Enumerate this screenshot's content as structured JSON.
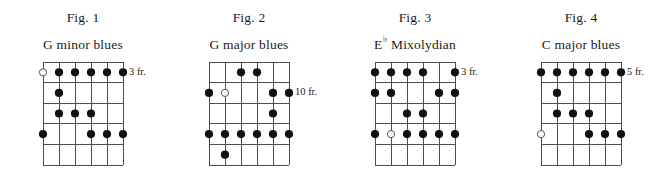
{
  "figures": [
    {
      "number": "Fig. 1",
      "title": "G minor blues",
      "title_root": "G",
      "title_accidental": "",
      "title_rest": "minor blues",
      "fret_label": "3 fr.",
      "fret_label_row": 1,
      "strings": 6,
      "frets": 5,
      "markers": [
        {
          "string": 1,
          "fret": 1,
          "type": "open"
        },
        {
          "string": 2,
          "fret": 1,
          "type": "filled"
        },
        {
          "string": 3,
          "fret": 1,
          "type": "filled"
        },
        {
          "string": 4,
          "fret": 1,
          "type": "filled"
        },
        {
          "string": 5,
          "fret": 1,
          "type": "filled"
        },
        {
          "string": 6,
          "fret": 1,
          "type": "filled"
        },
        {
          "string": 2,
          "fret": 2,
          "type": "filled"
        },
        {
          "string": 2,
          "fret": 3,
          "type": "filled"
        },
        {
          "string": 3,
          "fret": 3,
          "type": "filled"
        },
        {
          "string": 4,
          "fret": 3,
          "type": "filled"
        },
        {
          "string": 1,
          "fret": 4,
          "type": "filled"
        },
        {
          "string": 4,
          "fret": 4,
          "type": "filled"
        },
        {
          "string": 5,
          "fret": 4,
          "type": "filled"
        },
        {
          "string": 6,
          "fret": 4,
          "type": "filled"
        }
      ]
    },
    {
      "number": "Fig. 2",
      "title": "G major blues",
      "title_root": "G",
      "title_accidental": "",
      "title_rest": "major blues",
      "fret_label": "10  fr.",
      "fret_label_row": 2,
      "strings": 6,
      "frets": 5,
      "markers": [
        {
          "string": 3,
          "fret": 1,
          "type": "filled"
        },
        {
          "string": 4,
          "fret": 1,
          "type": "filled"
        },
        {
          "string": 1,
          "fret": 2,
          "type": "filled"
        },
        {
          "string": 2,
          "fret": 2,
          "type": "open"
        },
        {
          "string": 5,
          "fret": 2,
          "type": "filled"
        },
        {
          "string": 6,
          "fret": 2,
          "type": "filled"
        },
        {
          "string": 5,
          "fret": 3,
          "type": "filled"
        },
        {
          "string": 1,
          "fret": 4,
          "type": "filled"
        },
        {
          "string": 2,
          "fret": 4,
          "type": "filled"
        },
        {
          "string": 3,
          "fret": 4,
          "type": "filled"
        },
        {
          "string": 4,
          "fret": 4,
          "type": "filled"
        },
        {
          "string": 5,
          "fret": 4,
          "type": "filled"
        },
        {
          "string": 6,
          "fret": 4,
          "type": "filled"
        },
        {
          "string": 2,
          "fret": 5,
          "type": "filled"
        }
      ]
    },
    {
      "number": "Fig. 3",
      "title": "E♭ Mixolydian",
      "title_root": "E",
      "title_accidental": "♭",
      "title_rest": "Mixolydian",
      "fret_label": "3 fr.",
      "fret_label_row": 1,
      "strings": 6,
      "frets": 5,
      "markers": [
        {
          "string": 1,
          "fret": 1,
          "type": "filled"
        },
        {
          "string": 2,
          "fret": 1,
          "type": "filled"
        },
        {
          "string": 3,
          "fret": 1,
          "type": "filled"
        },
        {
          "string": 4,
          "fret": 1,
          "type": "filled"
        },
        {
          "string": 6,
          "fret": 1,
          "type": "filled"
        },
        {
          "string": 1,
          "fret": 2,
          "type": "filled"
        },
        {
          "string": 2,
          "fret": 2,
          "type": "filled"
        },
        {
          "string": 5,
          "fret": 2,
          "type": "filled"
        },
        {
          "string": 6,
          "fret": 2,
          "type": "filled"
        },
        {
          "string": 3,
          "fret": 3,
          "type": "filled"
        },
        {
          "string": 4,
          "fret": 3,
          "type": "filled"
        },
        {
          "string": 1,
          "fret": 4,
          "type": "filled"
        },
        {
          "string": 2,
          "fret": 4,
          "type": "open"
        },
        {
          "string": 3,
          "fret": 4,
          "type": "filled"
        },
        {
          "string": 4,
          "fret": 4,
          "type": "filled"
        },
        {
          "string": 5,
          "fret": 4,
          "type": "filled"
        },
        {
          "string": 6,
          "fret": 4,
          "type": "filled"
        }
      ]
    },
    {
      "number": "Fig. 4",
      "title": "C major blues",
      "title_root": "C",
      "title_accidental": "",
      "title_rest": "major blues",
      "fret_label": "5 fr.",
      "fret_label_row": 1,
      "strings": 6,
      "frets": 5,
      "markers": [
        {
          "string": 1,
          "fret": 1,
          "type": "filled"
        },
        {
          "string": 2,
          "fret": 1,
          "type": "filled"
        },
        {
          "string": 3,
          "fret": 1,
          "type": "filled"
        },
        {
          "string": 4,
          "fret": 1,
          "type": "filled"
        },
        {
          "string": 5,
          "fret": 1,
          "type": "filled"
        },
        {
          "string": 6,
          "fret": 1,
          "type": "filled"
        },
        {
          "string": 2,
          "fret": 2,
          "type": "filled"
        },
        {
          "string": 2,
          "fret": 3,
          "type": "filled"
        },
        {
          "string": 3,
          "fret": 3,
          "type": "filled"
        },
        {
          "string": 4,
          "fret": 3,
          "type": "filled"
        },
        {
          "string": 1,
          "fret": 4,
          "type": "open"
        },
        {
          "string": 4,
          "fret": 4,
          "type": "filled"
        },
        {
          "string": 5,
          "fret": 4,
          "type": "filled"
        },
        {
          "string": 6,
          "fret": 4,
          "type": "filled"
        }
      ]
    }
  ],
  "style": {
    "line_color": "#4d4d4d",
    "dot_fill": "#111111",
    "open_fill": "#ffffff",
    "open_stroke": "#555555",
    "text_color": "#1a1a1a"
  },
  "layout": {
    "figure_left_offsets": [
      0,
      166,
      332,
      498
    ]
  }
}
